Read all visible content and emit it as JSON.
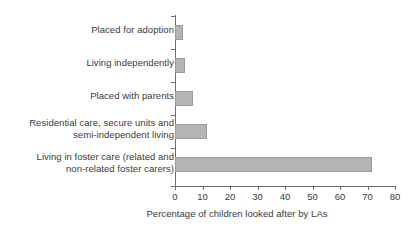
{
  "chart_data": {
    "type": "bar",
    "orientation": "horizontal",
    "title": "",
    "xlabel": "Percentage of children looked after by LAs",
    "ylabel": "",
    "xlim": [
      0,
      80
    ],
    "xticks": [
      0,
      10,
      20,
      30,
      40,
      50,
      60,
      70,
      80
    ],
    "xtick_labels": [
      "0",
      "10",
      "20",
      "30",
      "40",
      "50",
      "60",
      "70",
      "80"
    ],
    "grid": false,
    "legend": false,
    "bar_color": "#b4b4b4",
    "bar_edge_color": "#9a9a9a",
    "axis_color": "#6e6e6e",
    "categories": [
      "Placed for adoption",
      "Living independently",
      "Placed with parents",
      "Residential care, secure units and\nsemi-independent living",
      "Living in foster care (related and\nnon-related foster carers)"
    ],
    "values": [
      3,
      3.5,
      6.5,
      11.5,
      71.5
    ]
  }
}
